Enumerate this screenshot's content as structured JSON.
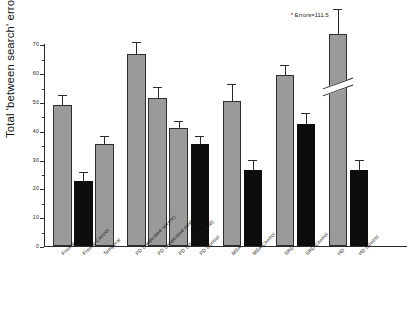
{
  "chart_data": {
    "type": "bar",
    "title": "",
    "xlabel": "",
    "ylabel": "Total 'between search' errors",
    "ylim": [
      0,
      75
    ],
    "yticks": [
      0,
      10,
      20,
      30,
      40,
      50,
      60,
      70
    ],
    "ytick_labels": [
      "0",
      "10",
      "20",
      "30",
      "40",
      "50",
      "60",
      "70"
    ],
    "grid": false,
    "legend": null,
    "axis_break": {
      "present": true,
      "on_category": "HD",
      "note": "diagonal break drawn across the HD bar; true value exceeds the plotted axis"
    },
    "annotations": [
      {
        "text": "* Errors=111.5",
        "refers_to": "HD"
      }
    ],
    "group_gaps_after": [
      "Temporal",
      "PD Control",
      "MSA Control",
      "SRD Control"
    ],
    "categories": [
      "Frontal",
      "Frontal Control",
      "Temporal",
      "PD (medicated severe)",
      "PD (medicated mild)",
      "PD (non-medicated)",
      "PD Control",
      "MSA",
      "MSA Control",
      "SRD",
      "SRD Control",
      "HD",
      "HD Control"
    ],
    "values": [
      49.0,
      22.5,
      35.5,
      66.5,
      51.5,
      41.0,
      35.5,
      50.5,
      26.5,
      59.5,
      42.5,
      73.5,
      26.5
    ],
    "errors": [
      3.0,
      3.0,
      2.5,
      4.0,
      3.5,
      2.0,
      2.5,
      5.5,
      3.0,
      3.0,
      3.5,
      8.5,
      3.0
    ],
    "colors": [
      "grey",
      "black",
      "grey",
      "grey",
      "grey",
      "grey",
      "black",
      "grey",
      "black",
      "grey",
      "black",
      "grey",
      "black"
    ],
    "series_colors": {
      "patients": "#9a9a9a",
      "controls": "#0d0d0d"
    }
  }
}
